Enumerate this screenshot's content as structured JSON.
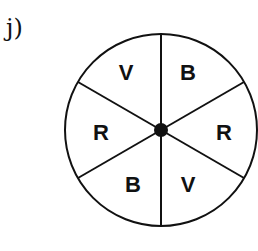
{
  "problem_label": "j)",
  "spinner": {
    "center": [
      161,
      130
    ],
    "radius": 96,
    "sector_count": 6,
    "sectors": [
      {
        "label": "B",
        "x": 188,
        "y": 80
      },
      {
        "label": "R",
        "x": 224,
        "y": 140
      },
      {
        "label": "V",
        "x": 188,
        "y": 192
      },
      {
        "label": "B",
        "x": 133,
        "y": 192
      },
      {
        "label": "R",
        "x": 101,
        "y": 140
      },
      {
        "label": "V",
        "x": 126,
        "y": 80
      }
    ]
  }
}
